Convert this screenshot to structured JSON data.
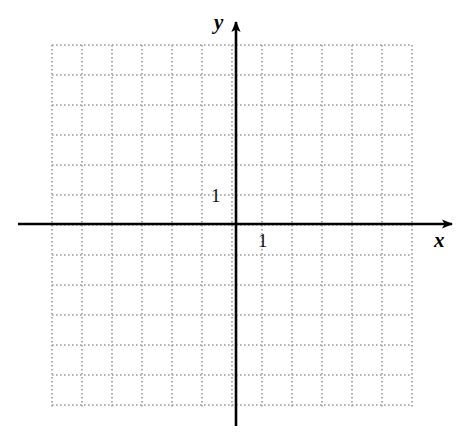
{
  "figure": {
    "kind": "coordinate-grid",
    "background_color": "#ffffff",
    "width": 474,
    "height": 440
  },
  "axes": {
    "x": {
      "label": "x",
      "unit_tick_label": "1",
      "color": "#000000",
      "line_width": 2.6,
      "start_x": 18,
      "end_x": 452,
      "y_position": 224,
      "arrow": "right"
    },
    "y": {
      "label": "y",
      "unit_tick_label": "1",
      "color": "#000000",
      "line_width": 2.6,
      "start_y": 426,
      "end_y": 22,
      "x_position": 236,
      "arrow": "up"
    }
  },
  "grid": {
    "color": "#9a9a9a",
    "style": "dotted",
    "dot_size": 1.6,
    "dot_gap": 2.4,
    "cell_size": 30,
    "left": 52,
    "top": 45,
    "right": 412,
    "bottom": 408,
    "columns": 12,
    "rows": 12,
    "origin_x": 236,
    "origin_y": 224
  },
  "chart_data": {
    "type": "scatter",
    "title": "",
    "subtitle": "",
    "xlabel": "x",
    "ylabel": "y",
    "series": [
      {
        "name": "empty",
        "x": [],
        "y": []
      }
    ],
    "annotations": [
      {
        "text": "1",
        "axis": "x",
        "value": 1
      },
      {
        "text": "1",
        "axis": "y",
        "value": 1
      }
    ],
    "xlim": [
      -6.1,
      5.9
    ],
    "ylim": [
      -6.1,
      5.9
    ],
    "xticks": [
      -6,
      -5,
      -4,
      -3,
      -2,
      -1,
      0,
      1,
      2,
      3,
      4,
      5
    ],
    "yticks": [
      -6,
      -5,
      -4,
      -3,
      -2,
      -1,
      0,
      1,
      2,
      3,
      4,
      5
    ],
    "xtick_labels": [
      "",
      "",
      "",
      "",
      "",
      "",
      "",
      "1",
      "",
      "",
      "",
      ""
    ],
    "ytick_labels": [
      "",
      "",
      "",
      "",
      "",
      "",
      "",
      "1",
      "",
      "",
      "",
      ""
    ],
    "grid": true,
    "grid_style": "dotted",
    "legend": false,
    "legend_position": "none"
  }
}
